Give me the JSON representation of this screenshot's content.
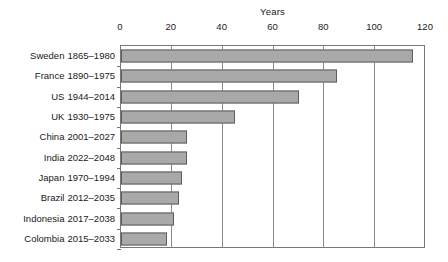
{
  "chart_data": {
    "type": "bar",
    "orientation": "horizontal",
    "title": "",
    "xlabel": "Years",
    "ylabel": "",
    "xlim": [
      0,
      120
    ],
    "xticks": [
      0,
      20,
      40,
      60,
      80,
      100,
      120
    ],
    "xtick_labels": [
      "0",
      "20",
      "40",
      "60",
      "80",
      "100",
      "120"
    ],
    "grid": true,
    "grid_axis": "x",
    "legend": false,
    "bar_fill_color": "#a9a9a9",
    "bar_edge_color": "#5d5d5d",
    "categories": [
      "Sweden 1865–1980",
      "France 1890–1975",
      "US 1944–2014",
      "UK 1930–1975",
      "China 2001–2027",
      "India 2022–2048",
      "Japan 1970–1994",
      "Brazil 2012–2035",
      "Indonesia 2017–2038",
      "Colombia 2015–2033"
    ],
    "values": [
      115,
      85,
      70,
      45,
      26,
      26,
      24,
      23,
      21,
      18
    ],
    "rows": [
      {
        "country": "Sweden",
        "period": "1865–1980",
        "label": "Sweden 1865–1980",
        "value": 115
      },
      {
        "country": "France",
        "period": "1890–1975",
        "label": "France 1890–1975",
        "value": 85
      },
      {
        "country": "US",
        "period": "1944–2014",
        "label": "US 1944–2014",
        "value": 70
      },
      {
        "country": "UK",
        "period": "1930–1975",
        "label": "UK 1930–1975",
        "value": 45
      },
      {
        "country": "China",
        "period": "2001–2027",
        "label": "China 2001–2027",
        "value": 26
      },
      {
        "country": "India",
        "period": "2022–2048",
        "label": "India 2022–2048",
        "value": 26
      },
      {
        "country": "Japan",
        "period": "1970–1994",
        "label": "Japan 1970–1994",
        "value": 24
      },
      {
        "country": "Brazil",
        "period": "2012–2035",
        "label": "Brazil 2012–2035",
        "value": 23
      },
      {
        "country": "Indonesia",
        "period": "2017–2038",
        "label": "Indonesia 2017–2038",
        "value": 21
      },
      {
        "country": "Colombia",
        "period": "2015–2033",
        "label": "Colombia 2015–2033",
        "value": 18
      }
    ]
  }
}
